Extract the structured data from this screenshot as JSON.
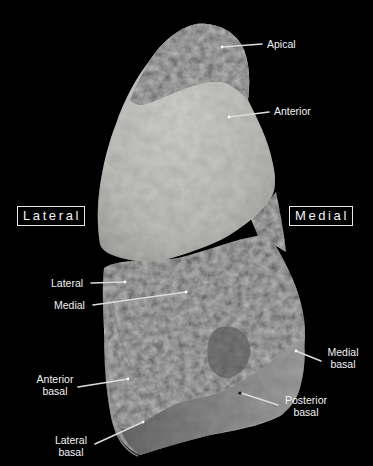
{
  "figure": {
    "background_color": "#000000",
    "orientation_labels": {
      "left": "Lateral",
      "right": "Medial"
    },
    "segment_labels": {
      "apical": "Apical",
      "anterior": "Anterior",
      "lateral": "Lateral",
      "medial": "Medial",
      "medial_basal_line1": "Medial",
      "medial_basal_line2": "basal",
      "anterior_basal_line1": "Anterior",
      "anterior_basal_line2": "basal",
      "posterior_basal_line1": "Posterior",
      "posterior_basal_line2": "basal",
      "lateral_basal_line1": "Lateral",
      "lateral_basal_line2": "basal"
    },
    "colors": {
      "label_text": "#f2f2f2",
      "leader_line": "#d9d9d9",
      "light_tissue": "#c9c9c6",
      "dark_tissue": "#2a2a2a",
      "basal_band": "#8f8f8f"
    }
  }
}
